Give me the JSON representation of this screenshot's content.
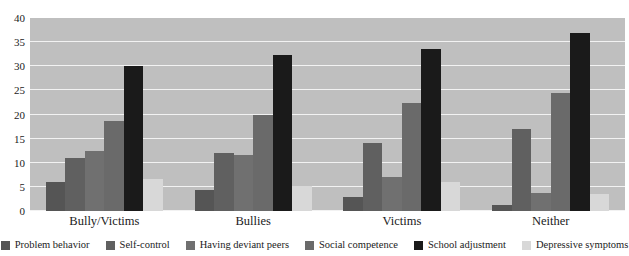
{
  "chart_data": {
    "type": "bar",
    "title": "",
    "subtitle": "",
    "xlabel": "",
    "ylabel": "",
    "ylim": [
      0,
      40
    ],
    "ytick_values": [
      0,
      5,
      10,
      15,
      20,
      25,
      30,
      35,
      40
    ],
    "ytick_labels": [
      "0",
      "5",
      "10",
      "15",
      "20",
      "25",
      "30",
      "35",
      "40"
    ],
    "grid": true,
    "legend_position": "bottom",
    "categories": [
      "Bully/Victims",
      "Bullies",
      "Victims",
      "Neither"
    ],
    "series": [
      {
        "name": "Problem behavior",
        "color": "#555555",
        "values": [
          6.0,
          4.3,
          3.0,
          1.2
        ]
      },
      {
        "name": "Self-control",
        "color": "#606060",
        "values": [
          11.0,
          12.1,
          14.2,
          17.0
        ]
      },
      {
        "name": "Having deviant peers",
        "color": "#707070",
        "values": [
          12.5,
          11.7,
          7.0,
          3.8
        ]
      },
      {
        "name": "Social competence",
        "color": "#6a6a6a",
        "values": [
          18.7,
          20.0,
          22.3,
          24.5
        ]
      },
      {
        "name": "School adjustment",
        "color": "#1a1a1a",
        "values": [
          30.0,
          32.4,
          33.5,
          36.8
        ]
      },
      {
        "name": "Depressive symptoms",
        "color": "#d8d8d8",
        "values": [
          6.7,
          5.2,
          6.0,
          3.5
        ]
      }
    ],
    "plot_background": "#bfbfbf",
    "gridline_color": "#f2f2f2",
    "page_background": "#ffffff"
  }
}
